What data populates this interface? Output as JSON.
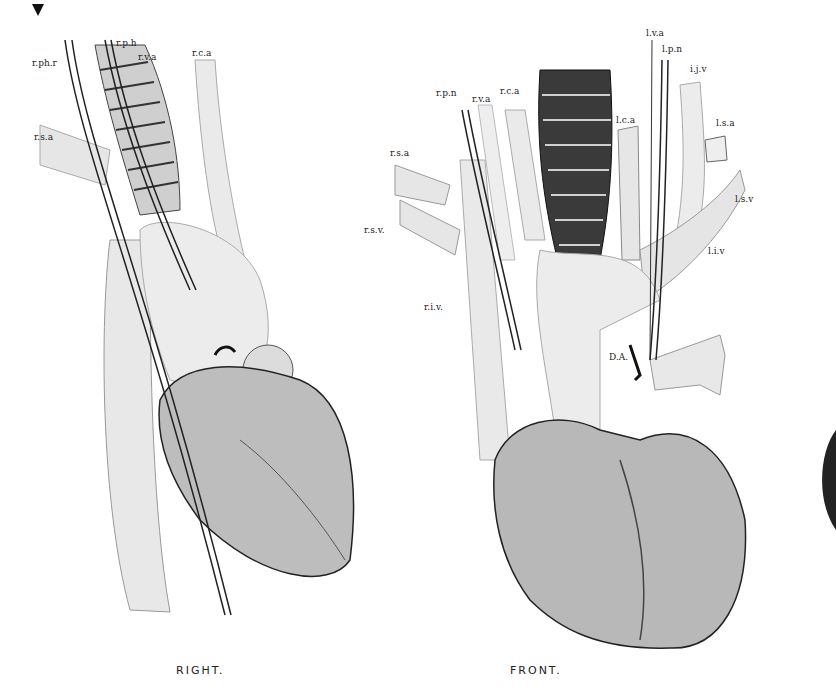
{
  "figure": {
    "views": [
      {
        "caption": "RIGHT.",
        "labels": [
          "r.ph.r",
          "r.p.h",
          "r.v.a",
          "r.c.a",
          "r.s.a"
        ]
      },
      {
        "caption": "FRONT.",
        "labels": [
          "r.p.n",
          "r.v.a",
          "r.c.a",
          "r.s.a",
          "r.s.v.",
          "r.i.v.",
          "l.v.a",
          "l.p.n",
          "i.j.v",
          "l.c.a",
          "l.s.a",
          "l.s.v",
          "l.i.v",
          "D.A."
        ]
      }
    ]
  }
}
